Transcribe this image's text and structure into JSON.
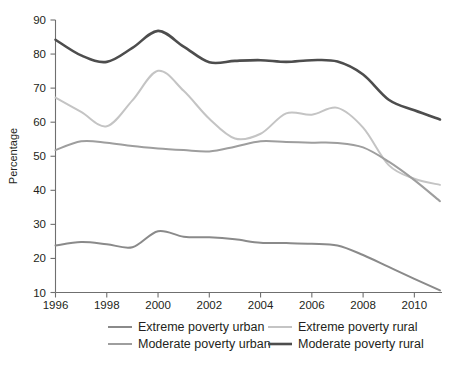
{
  "chart_data": {
    "type": "line",
    "title": "",
    "xlabel": "",
    "ylabel": "Percentage",
    "xlim": [
      1996,
      2011
    ],
    "ylim": [
      10,
      90
    ],
    "grid": false,
    "legend_position": "bottom",
    "x_ticks": [
      "1996",
      "1998",
      "2000",
      "2002",
      "2004",
      "2006",
      "2008",
      "2010"
    ],
    "x_tick_values": [
      1996,
      1998,
      2000,
      2002,
      2004,
      2006,
      2008,
      2010
    ],
    "y_ticks": [
      "10",
      "20",
      "30",
      "40",
      "50",
      "60",
      "70",
      "80",
      "90"
    ],
    "y_tick_values": [
      10,
      20,
      30,
      40,
      50,
      60,
      70,
      80,
      90
    ],
    "x": [
      1996,
      1997,
      1998,
      1999,
      2000,
      2001,
      2002,
      2003,
      2004,
      2005,
      2006,
      2007,
      2008,
      2009,
      2010,
      2011
    ],
    "series": [
      {
        "name": "Extreme poverty urban",
        "color": "#8a8a8a",
        "width": 2.0,
        "values": [
          23.8,
          24.8,
          24.2,
          23.3,
          28.0,
          26.4,
          26.2,
          25.6,
          24.6,
          24.5,
          24.3,
          23.8,
          21.0,
          17.5,
          14.0,
          10.6
        ]
      },
      {
        "name": "Moderate poverty urban",
        "color": "#9e9e9e",
        "width": 2.0,
        "values": [
          51.8,
          54.4,
          54.0,
          53.0,
          52.3,
          51.8,
          51.4,
          52.8,
          54.4,
          54.2,
          54.0,
          53.9,
          52.6,
          48.4,
          43.0,
          36.8
        ]
      },
      {
        "name": "Extreme poverty rural",
        "color": "#c4c4c4",
        "width": 2.0,
        "values": [
          67.2,
          63.0,
          58.8,
          66.4,
          75.1,
          69.2,
          61.0,
          55.2,
          56.6,
          62.6,
          62.2,
          64.2,
          58.4,
          47.4,
          43.4,
          41.6
        ]
      },
      {
        "name": "Moderate poverty rural",
        "color": "#4d4d4d",
        "width": 2.6,
        "values": [
          84.2,
          79.6,
          77.7,
          81.8,
          86.8,
          82.2,
          77.6,
          78.0,
          78.2,
          77.7,
          78.2,
          77.8,
          74.0,
          66.6,
          63.5,
          60.8
        ]
      }
    ]
  },
  "axis": {
    "y_title": "Percentage"
  },
  "legend": {
    "items": [
      {
        "label": "Extreme poverty urban",
        "color": "#8a8a8a",
        "width": 2.0
      },
      {
        "label": "Extreme poverty rural",
        "color": "#c4c4c4",
        "width": 2.0
      },
      {
        "label": "Moderate poverty urban",
        "color": "#9e9e9e",
        "width": 2.0
      },
      {
        "label": "Moderate poverty rural",
        "color": "#4d4d4d",
        "width": 2.6
      }
    ]
  }
}
